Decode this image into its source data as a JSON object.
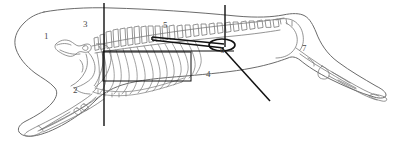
{
  "figure": {
    "kind": "anatomical-line-drawing",
    "width": 393,
    "height": 163,
    "background_color": "#ffffff",
    "outline_color": "#6b6b6b",
    "bone_color": "#7a7a7a",
    "annotation_color": "#111111",
    "label_color": "#4a4a4a"
  },
  "labels": [
    {
      "id": "label-1",
      "text": "1",
      "x": 44,
      "y": 32
    },
    {
      "id": "label-2",
      "text": "2",
      "x": 73,
      "y": 86
    },
    {
      "id": "label-3",
      "text": "3",
      "x": 83,
      "y": 20
    },
    {
      "id": "label-4",
      "text": "4",
      "x": 206,
      "y": 70
    },
    {
      "id": "label-5",
      "text": "5",
      "x": 163,
      "y": 21
    },
    {
      "id": "label-6",
      "text": "6",
      "x": 220,
      "y": 46
    },
    {
      "id": "label-7",
      "text": "7",
      "x": 302,
      "y": 44
    }
  ],
  "annotations": {
    "vertical_line_left": {
      "x": 104,
      "y1": 3,
      "y2": 126
    },
    "vertical_line_right": {
      "x": 225,
      "y1": 5,
      "y2": 47
    },
    "horizontal_line": {
      "y": 51,
      "x1": 103,
      "x2": 234
    },
    "rectangle": {
      "x": 103,
      "y": 52,
      "width": 88,
      "height": 29
    },
    "ellipse_marker": {
      "cx": 222,
      "cy": 45,
      "rx": 13,
      "ry": 6
    },
    "wedge_pointer": {
      "from_x": 152,
      "from_y": 38,
      "to_x": 224,
      "to_y": 46
    },
    "diagonal_pointer": {
      "x1": 222,
      "y1": 48,
      "x2": 270,
      "y2": 101
    }
  }
}
